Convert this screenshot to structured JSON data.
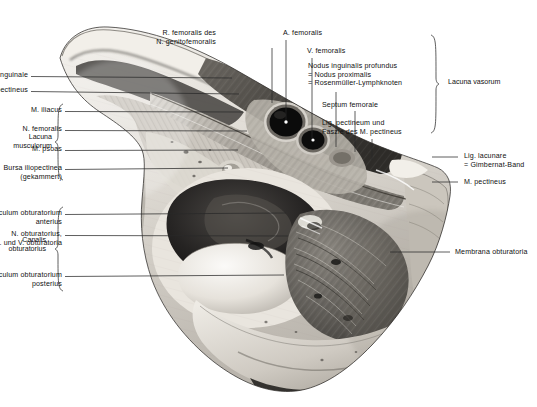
{
  "figure": {
    "background_color": "#ffffff",
    "ink_color": "#111111",
    "leader_color": "#2a2a2a"
  },
  "labels_left": [
    {
      "id": "lig-inguinale",
      "text": "Lig. inguinale",
      "x": 28,
      "y": 71,
      "leader_to_x": 232,
      "leader_to_y": 78
    },
    {
      "id": "arcus-iliopectineus",
      "text": "Arcus iliopectineus",
      "x": 28,
      "y": 86,
      "leader_to_x": 239,
      "leader_to_y": 94
    },
    {
      "id": "m-iliacus",
      "text": "M. iliacus",
      "x": 62,
      "y": 106,
      "leader_to_x": 243,
      "leader_to_y": 112
    },
    {
      "id": "n-femoralis",
      "text": "N. femoralis",
      "x": 62,
      "y": 125,
      "leader_to_x": 247,
      "leader_to_y": 131
    },
    {
      "id": "m-psoas",
      "text": "M. psoas",
      "x": 62,
      "y": 145,
      "leader_to_x": 238,
      "leader_to_y": 150
    },
    {
      "id": "bursa-iliopectinea",
      "text": "Bursa iliopectinea\n(gekammert)",
      "x": 62,
      "y": 164,
      "leader_to_x": 228,
      "leader_to_y": 168
    }
  ],
  "labels_left_lower": [
    {
      "id": "tuberculum-obturatorium-anterius",
      "text": "Tuberculum obturatorium\nanterius",
      "x": 62,
      "y": 209,
      "leader_to_x": 286,
      "leader_to_y": 213
    },
    {
      "id": "n-obturatorius",
      "text": "N. obturatorius,\nA. und V. obturatoria",
      "x": 62,
      "y": 230,
      "leader_to_x": 288,
      "leader_to_y": 236
    },
    {
      "id": "tuberculum-obturatorium-posterius",
      "text": "Tuberculum obturatorium\nposterius",
      "x": 62,
      "y": 271,
      "leader_to_x": 284,
      "leader_to_y": 275
    }
  ],
  "labels_top": [
    {
      "id": "r-femoralis-n-genitofemoralis",
      "text": "R. femoralis des\nN. genitofemoralis",
      "x": 216,
      "y": 29,
      "align": "right",
      "leader_x": 272,
      "leader_from_y": 48,
      "leader_to_y": 103
    },
    {
      "id": "a-femoralis",
      "text": "A. femoralis",
      "x": 283,
      "y": 29,
      "align": "left",
      "leader_x": 286,
      "leader_from_y": 40,
      "leader_to_y": 121
    },
    {
      "id": "v-femoralis",
      "text": "V. femoralis",
      "x": 307,
      "y": 47,
      "align": "left",
      "leader_x": 312,
      "leader_from_y": 58,
      "leader_to_y": 139
    }
  ],
  "labels_right_block": [
    {
      "id": "nodus-inguinalis-profundus",
      "text": "Nodus inguinalis profundus\n= Nodus proximalis\n= Rosenmüller-Lymphknoten",
      "x": 308,
      "y": 62,
      "leader_x": 336,
      "leader_from_y": 92,
      "leader_to_y": 147
    },
    {
      "id": "septum-femorale",
      "text": "Septum femorale",
      "x": 322,
      "y": 101,
      "leader_x": 355,
      "leader_from_y": 111,
      "leader_to_y": 152
    },
    {
      "id": "lig-pectineum",
      "text": "Lig. pectineum und\nFaszie des M. pectineus",
      "x": 322,
      "y": 119,
      "leader_x": 372,
      "leader_from_y": 139,
      "leader_to_y": 160
    }
  ],
  "labels_right": [
    {
      "id": "lig-lacunare",
      "text": "Lig. lacunare\n= Gimbernat-Band",
      "x": 464,
      "y": 152,
      "leader_from_x": 432,
      "leader_to_x": 458,
      "leader_y": 157
    },
    {
      "id": "m-pectineus",
      "text": "M. pectineus",
      "x": 464,
      "y": 178,
      "leader_from_x": 432,
      "leader_to_x": 458,
      "leader_y": 182
    },
    {
      "id": "membrana-obturatoria",
      "text": "Membrana obturatoria",
      "x": 455,
      "y": 248,
      "leader_from_x": 390,
      "leader_to_x": 450,
      "leader_y": 252
    }
  ],
  "groups": [
    {
      "id": "lacuna-musculorum",
      "text": "Lacuna\nmusculorum",
      "x": 18,
      "y": 133,
      "brace_x": 56,
      "brace_top": 104,
      "brace_bottom": 180,
      "brace_side": "left"
    },
    {
      "id": "canalis-obturatorius",
      "text": "Canalis\nobturatorius",
      "x": 12,
      "y": 236,
      "brace_x": 56,
      "brace_top": 207,
      "brace_bottom": 291,
      "brace_side": "left"
    },
    {
      "id": "lacuna-vasorum",
      "text": "Lacuna vasorum",
      "x": 448,
      "y": 78,
      "brace_x": 438,
      "brace_top": 35,
      "brace_bottom": 133,
      "brace_side": "right"
    }
  ],
  "structures": {
    "a_femoralis_lumen": {
      "cx": 286,
      "cy": 122,
      "rx": 19,
      "ry": 17
    },
    "v_femoralis_lumen": {
      "cx": 313,
      "cy": 139,
      "rx": 15,
      "ry": 13
    },
    "acetabular_fossa": {
      "cx": 250,
      "cy": 225,
      "rx": 62,
      "ry": 40
    },
    "femoral_head": {
      "cx": 243,
      "cy": 277,
      "rx": 57,
      "ry": 35
    },
    "obturator_membrane": {
      "cx": 348,
      "cy": 275,
      "rx": 62,
      "ry": 60
    }
  }
}
